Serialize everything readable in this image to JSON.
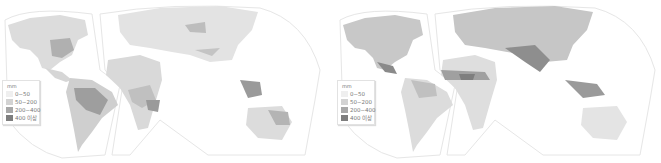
{
  "maps": [
    {
      "id": "left",
      "legend": {
        "unit": "mm",
        "items": [
          {
            "label": "0~50",
            "color": "#efefef"
          },
          {
            "label": "50~200",
            "color": "#d3d3d3"
          },
          {
            "label": "200~400",
            "color": "#a8a8a8"
          },
          {
            "label": "400 이상",
            "color": "#7e7e7e"
          }
        ]
      }
    },
    {
      "id": "right",
      "legend": {
        "unit": "mm",
        "items": [
          {
            "label": "0~50",
            "color": "#efefef"
          },
          {
            "label": "50~200",
            "color": "#d3d3d3"
          },
          {
            "label": "200~400",
            "color": "#a8a8a8"
          },
          {
            "label": "400 이상",
            "color": "#7e7e7e"
          }
        ]
      }
    }
  ]
}
